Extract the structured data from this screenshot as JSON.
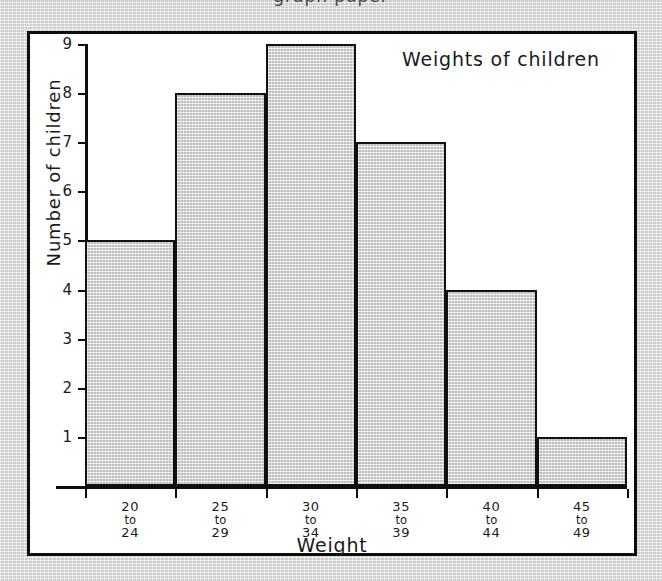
{
  "page": {
    "background_color": "#dbdbdb",
    "clipped_header_text": "graph paper"
  },
  "figure": {
    "frame_color": "#0e0e0e",
    "paper_color": "#ffffff"
  },
  "chart_data": {
    "type": "bar",
    "title": "Weights of children",
    "xlabel": "Weight",
    "ylabel": "Number of children",
    "categories": [
      "20\nto\n24",
      "25\nto\n29",
      "30\nto\n34",
      "35\nto\n39",
      "40\nto\n44",
      "45\nto\n49"
    ],
    "category_parts": [
      {
        "low": "20",
        "to": "to",
        "high": "24"
      },
      {
        "low": "25",
        "to": "to",
        "high": "29"
      },
      {
        "low": "30",
        "to": "to",
        "high": "34"
      },
      {
        "low": "35",
        "to": "to",
        "high": "39"
      },
      {
        "low": "40",
        "to": "to",
        "high": "44"
      },
      {
        "low": "45",
        "to": "to",
        "high": "49"
      }
    ],
    "values": [
      5,
      8,
      9,
      7,
      4,
      1
    ],
    "ytick_labels": [
      "1",
      "2",
      "3",
      "4",
      "5",
      "6",
      "7",
      "8",
      "9"
    ],
    "ylim": [
      0,
      9
    ],
    "xlim_note": "contiguous histogram bars, no gaps",
    "grid": false,
    "legend": false,
    "bar_fill_color": "#dedede",
    "bar_edge_color": "#111111"
  }
}
